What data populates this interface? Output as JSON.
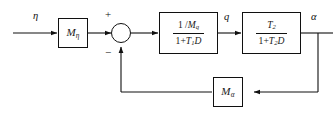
{
  "diagram": {
    "type": "control-system-block-diagram",
    "background_color": "#ffffff",
    "line_color": "#101010",
    "signals": {
      "input": "η",
      "intermediate": "q",
      "output": "α"
    },
    "summing_junction": {
      "style": "crossed-circle",
      "plus_sign": "+",
      "minus_sign": "−",
      "plus_input": "forward",
      "minus_input": "feedback"
    },
    "blocks": [
      {
        "id": "gain-eta",
        "kind": "gain",
        "symbol": "M",
        "subscript": "η",
        "label": "Mη"
      },
      {
        "id": "lag-1",
        "kind": "transfer-function",
        "numerator": "1 / Mq",
        "numerator_parts": {
          "lead": "1 /",
          "symbol": "M",
          "subscript": "q"
        },
        "denominator": "1 + T1D",
        "denominator_parts": {
          "one": "1",
          "op": "+",
          "symbol": "T",
          "subscript": "1",
          "operator_d": "D"
        },
        "label": "(1/Mq)/(1+T1D)"
      },
      {
        "id": "lag-2",
        "kind": "transfer-function",
        "numerator": "T2",
        "numerator_parts": {
          "symbol": "T",
          "subscript": "2"
        },
        "denominator": "1 + T2D",
        "denominator_parts": {
          "one": "1",
          "op": "+",
          "symbol": "T",
          "subscript": "2",
          "operator_d": "D"
        },
        "label": "T2/(1+T2D)"
      },
      {
        "id": "gain-alpha",
        "kind": "gain",
        "symbol": "M",
        "subscript": "α",
        "label": "Mα"
      }
    ],
    "feedback_path": {
      "from": "α",
      "through": "Mα",
      "to": "summing-junction",
      "sign": "−"
    }
  }
}
